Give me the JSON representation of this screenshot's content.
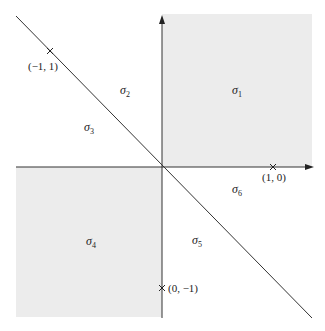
{
  "diagram": {
    "colors": {
      "shade": "#ececec",
      "line": "#333333",
      "background": "#ffffff"
    },
    "shaded_cones": [
      "sigma_1",
      "sigma_4"
    ],
    "points": [
      {
        "label": "(−1, 1)",
        "coords": [
          -1,
          1
        ]
      },
      {
        "label": "(1, 0)",
        "coords": [
          1,
          0
        ]
      },
      {
        "label": "(0, −1)",
        "coords": [
          0,
          -1
        ]
      }
    ],
    "cones": [
      {
        "symbol": "σ",
        "index": "1"
      },
      {
        "symbol": "σ",
        "index": "2"
      },
      {
        "symbol": "σ",
        "index": "3"
      },
      {
        "symbol": "σ",
        "index": "4"
      },
      {
        "symbol": "σ",
        "index": "5"
      },
      {
        "symbol": "σ",
        "index": "6"
      }
    ]
  }
}
